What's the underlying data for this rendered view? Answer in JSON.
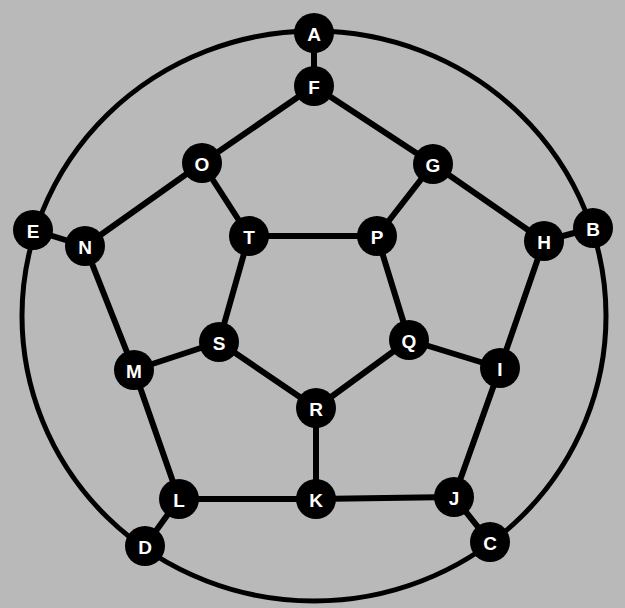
{
  "diagram": {
    "type": "graph",
    "colors": {
      "background": "#b9b9b9",
      "node_fill": "#000000",
      "label": "#ffffff",
      "edge": "#000000"
    },
    "outer_ellipse": {
      "cx": 314,
      "cy": 316,
      "rx": 292,
      "ry": 285
    },
    "node_radius": 20,
    "nodes": [
      {
        "id": "A",
        "x": 314,
        "y": 33
      },
      {
        "id": "B",
        "x": 593,
        "y": 228
      },
      {
        "id": "C",
        "x": 490,
        "y": 542
      },
      {
        "id": "D",
        "x": 145,
        "y": 546
      },
      {
        "id": "E",
        "x": 33,
        "y": 230
      },
      {
        "id": "F",
        "x": 314,
        "y": 86
      },
      {
        "id": "G",
        "x": 433,
        "y": 164
      },
      {
        "id": "H",
        "x": 544,
        "y": 241
      },
      {
        "id": "I",
        "x": 500,
        "y": 368
      },
      {
        "id": "J",
        "x": 454,
        "y": 497
      },
      {
        "id": "K",
        "x": 316,
        "y": 499
      },
      {
        "id": "L",
        "x": 179,
        "y": 499
      },
      {
        "id": "M",
        "x": 134,
        "y": 370
      },
      {
        "id": "N",
        "x": 85,
        "y": 246
      },
      {
        "id": "O",
        "x": 202,
        "y": 163
      },
      {
        "id": "P",
        "x": 377,
        "y": 236
      },
      {
        "id": "Q",
        "x": 409,
        "y": 340
      },
      {
        "id": "R",
        "x": 316,
        "y": 408
      },
      {
        "id": "S",
        "x": 219,
        "y": 342
      },
      {
        "id": "T",
        "x": 249,
        "y": 236
      }
    ],
    "edges": [
      [
        "A",
        "F"
      ],
      [
        "B",
        "H"
      ],
      [
        "C",
        "J"
      ],
      [
        "D",
        "L"
      ],
      [
        "E",
        "N"
      ],
      [
        "F",
        "G"
      ],
      [
        "G",
        "H"
      ],
      [
        "H",
        "I"
      ],
      [
        "I",
        "J"
      ],
      [
        "J",
        "K"
      ],
      [
        "K",
        "L"
      ],
      [
        "L",
        "M"
      ],
      [
        "M",
        "N"
      ],
      [
        "N",
        "O"
      ],
      [
        "O",
        "F"
      ],
      [
        "O",
        "T"
      ],
      [
        "G",
        "P"
      ],
      [
        "I",
        "Q"
      ],
      [
        "K",
        "R"
      ],
      [
        "M",
        "S"
      ],
      [
        "T",
        "P"
      ],
      [
        "P",
        "Q"
      ],
      [
        "Q",
        "R"
      ],
      [
        "R",
        "S"
      ],
      [
        "S",
        "T"
      ]
    ],
    "outer_cycle": [
      "A",
      "B",
      "C",
      "D",
      "E"
    ]
  }
}
